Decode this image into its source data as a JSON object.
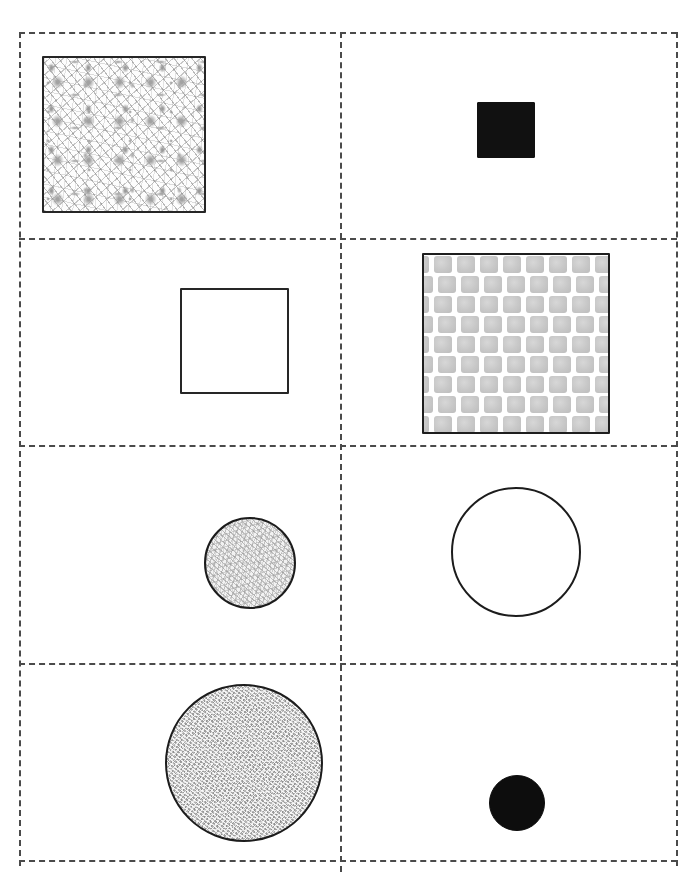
{
  "stimulus": {
    "title": "Shape Grid Stimulus",
    "canvas": {
      "width": 696,
      "height": 878,
      "background": "#ffffff"
    },
    "grid": {
      "rows": 4,
      "columns": 2,
      "border_style": "dashed",
      "border_color": "#4a4a4a",
      "border_width_px": 2,
      "left_px": 19,
      "right_px": 676,
      "top_px": 32,
      "bottom_px": 860,
      "vertical_divider_x_px": 340,
      "horizontal_divider_y_px": [
        238,
        445,
        663
      ]
    },
    "cells": [
      {
        "id": "cell-r1c1",
        "row": 1,
        "column": 1,
        "shape": "square",
        "size": "large",
        "fill": "light-speckle-texture",
        "outline_color": "#262626",
        "x_px": 42,
        "y_px": 56,
        "width_px": 164,
        "height_px": 157
      },
      {
        "id": "cell-r1c2",
        "row": 1,
        "column": 2,
        "shape": "square",
        "size": "small",
        "fill": "solid-black",
        "outline_color": "#111111",
        "x_px": 477,
        "y_px": 102,
        "width_px": 58,
        "height_px": 56
      },
      {
        "id": "cell-r2c1",
        "row": 2,
        "column": 1,
        "shape": "square",
        "size": "medium",
        "fill": "none-white",
        "outline_color": "#262626",
        "x_px": 180,
        "y_px": 288,
        "width_px": 109,
        "height_px": 106
      },
      {
        "id": "cell-r2c2",
        "row": 2,
        "column": 2,
        "shape": "square",
        "size": "large",
        "fill": "brick-checker-texture",
        "outline_color": "#1e1e1e",
        "x_px": 422,
        "y_px": 253,
        "width_px": 188,
        "height_px": 181
      },
      {
        "id": "cell-r3c1",
        "row": 3,
        "column": 1,
        "shape": "circle",
        "size": "small",
        "fill": "light-noise-texture",
        "outline_color": "#1c1c1c",
        "x_px": 204,
        "y_px": 517,
        "width_px": 92,
        "height_px": 92
      },
      {
        "id": "cell-r3c2",
        "row": 3,
        "column": 2,
        "shape": "circle",
        "size": "large",
        "fill": "none-white",
        "outline_color": "#1c1c1c",
        "x_px": 451,
        "y_px": 487,
        "width_px": 130,
        "height_px": 130
      },
      {
        "id": "cell-r4c1",
        "row": 4,
        "column": 1,
        "shape": "circle",
        "size": "large",
        "fill": "gray-noise-texture",
        "outline_color": "#1c1c1c",
        "x_px": 165,
        "y_px": 684,
        "width_px": 158,
        "height_px": 158
      },
      {
        "id": "cell-r4c2",
        "row": 4,
        "column": 2,
        "shape": "circle",
        "size": "small",
        "fill": "solid-black",
        "outline_color": "#0d0d0d",
        "x_px": 489,
        "y_px": 775,
        "width_px": 56,
        "height_px": 56
      }
    ],
    "brick_pattern": {
      "rows": 9,
      "bricks_per_row": 8,
      "brick_width_px": 18,
      "brick_height_px": 17,
      "row_height_px": 20,
      "offset_px": 10,
      "brick_color": "#c9c9c9",
      "gap_color": "#ffffff"
    }
  }
}
